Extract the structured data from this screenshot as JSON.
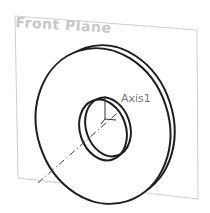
{
  "viewport": {
    "plane": {
      "label": "Front Plane",
      "color": "#c8c8c8"
    },
    "axis": {
      "label": "Axis1",
      "color": "#777777"
    },
    "part": {
      "name": "washer",
      "edge_color": "#222222"
    }
  }
}
